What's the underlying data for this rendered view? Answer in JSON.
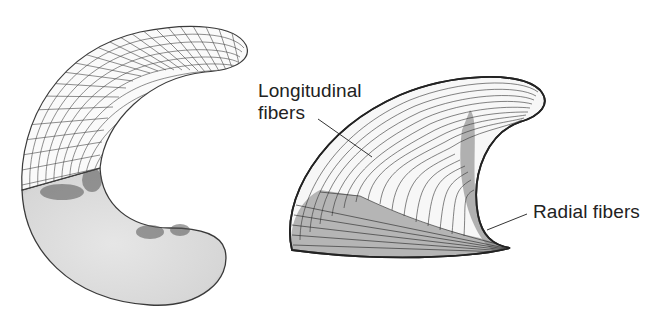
{
  "figure": {
    "panels": [
      {
        "name": "left-c-shaped-model",
        "description": "C-shaped model with grid mesh on upper half and shaded solid lower half"
      },
      {
        "name": "right-horn-shaped-model",
        "description": "Horn-shaped 3D model showing longitudinal and radial fiber lines"
      }
    ],
    "labels": {
      "longitudinal_line1": "Longitudinal",
      "longitudinal_line2": "fibers",
      "radial": "Radial fibers"
    },
    "colors": {
      "background": "#ffffff",
      "line": "#333333",
      "shade": "#dcdcdc",
      "dark_shade": "#555555",
      "text": "#222222"
    }
  }
}
